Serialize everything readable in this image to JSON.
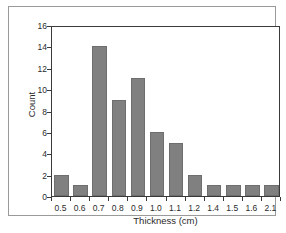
{
  "chart_data": {
    "type": "bar",
    "title": "",
    "subtitle": "",
    "xlabel": "Thickness (cm)",
    "ylabel": "Count",
    "categories": [
      "0.5",
      "0.6",
      "0.7",
      "0.8",
      "0.9",
      "1.0",
      "1.1",
      "1.2",
      "1.4",
      "1.5",
      "1.6",
      "2.1"
    ],
    "values": [
      2,
      1,
      14,
      9,
      11,
      6,
      5,
      2,
      1,
      1,
      1,
      1
    ],
    "ylim": [
      0,
      16
    ],
    "yticks": [
      0,
      2,
      4,
      6,
      8,
      10,
      12,
      14,
      16
    ],
    "ytick_labels": [
      "0",
      "2",
      "4",
      "6",
      "8",
      "10",
      "12",
      "14",
      "16"
    ],
    "xtick_labels": [
      "0.5",
      "0.6",
      "0.7",
      "0.8",
      "0.9",
      "1.0",
      "1.1",
      "1.2",
      "1.4",
      "1.5",
      "1.6",
      "2.1"
    ],
    "grid": false,
    "legend": false,
    "legend_position": "none",
    "bar_color": "#808080",
    "bar_edge_color": "#6e6e6e",
    "axis_color": "#3a3a3a",
    "frame_color": "#9a9a9a",
    "background_color": "#ffffff",
    "annotations": []
  }
}
